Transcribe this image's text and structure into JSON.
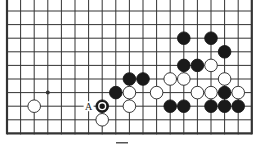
{
  "diagram": {
    "type": "go-board-fragment",
    "columns": 19,
    "rows": 10,
    "edges": {
      "left": true,
      "right": true,
      "bottom": true,
      "top": false
    },
    "star_points": [
      {
        "col": 3,
        "row": 6
      }
    ],
    "stones": [
      {
        "col": 13,
        "row": 2,
        "color": "black"
      },
      {
        "col": 15,
        "row": 2,
        "color": "black"
      },
      {
        "col": 16,
        "row": 3,
        "color": "black"
      },
      {
        "col": 13,
        "row": 4,
        "color": "black"
      },
      {
        "col": 14,
        "row": 4,
        "color": "black"
      },
      {
        "col": 15,
        "row": 4,
        "color": "white"
      },
      {
        "col": 9,
        "row": 5,
        "color": "black"
      },
      {
        "col": 10,
        "row": 5,
        "color": "black"
      },
      {
        "col": 12,
        "row": 5,
        "color": "white"
      },
      {
        "col": 13,
        "row": 5,
        "color": "white"
      },
      {
        "col": 16,
        "row": 5,
        "color": "white"
      },
      {
        "col": 8,
        "row": 6,
        "color": "black"
      },
      {
        "col": 9,
        "row": 6,
        "color": "white"
      },
      {
        "col": 11,
        "row": 6,
        "color": "white"
      },
      {
        "col": 14,
        "row": 6,
        "color": "white"
      },
      {
        "col": 15,
        "row": 6,
        "color": "white"
      },
      {
        "col": 16,
        "row": 6,
        "color": "black"
      },
      {
        "col": 17,
        "row": 6,
        "color": "white"
      },
      {
        "col": 2,
        "row": 7,
        "color": "white"
      },
      {
        "col": 7,
        "row": 7,
        "color": "black",
        "marked": true
      },
      {
        "col": 9,
        "row": 7,
        "color": "white"
      },
      {
        "col": 12,
        "row": 7,
        "color": "black"
      },
      {
        "col": 13,
        "row": 7,
        "color": "black"
      },
      {
        "col": 15,
        "row": 7,
        "color": "black"
      },
      {
        "col": 16,
        "row": 7,
        "color": "black"
      },
      {
        "col": 17,
        "row": 7,
        "color": "black"
      },
      {
        "col": 7,
        "row": 8,
        "color": "white"
      }
    ],
    "labels": [
      {
        "col": 6,
        "row": 7,
        "text": "A"
      }
    ],
    "colors": {
      "line": "#333333",
      "black": "#1a1a1a",
      "white": "#ffffff"
    }
  }
}
